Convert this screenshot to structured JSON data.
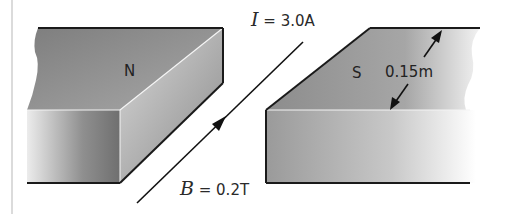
{
  "figure": {
    "north_pole": {
      "label": "N"
    },
    "south_pole": {
      "label": "S"
    },
    "current": {
      "symbol": "I",
      "equals": " = ",
      "value": "3.0A"
    },
    "field": {
      "symbol": "B",
      "equals": " = ",
      "value": "0.2T"
    },
    "gap_dimension": {
      "value": "0.15m"
    },
    "colors": {
      "outline": "#1a1a1a",
      "magnet_top_dark": "#8a8a8a",
      "magnet_front_light": "#e0e0e0",
      "wire": "#111111",
      "left_rule": "#cfcfcf"
    }
  }
}
